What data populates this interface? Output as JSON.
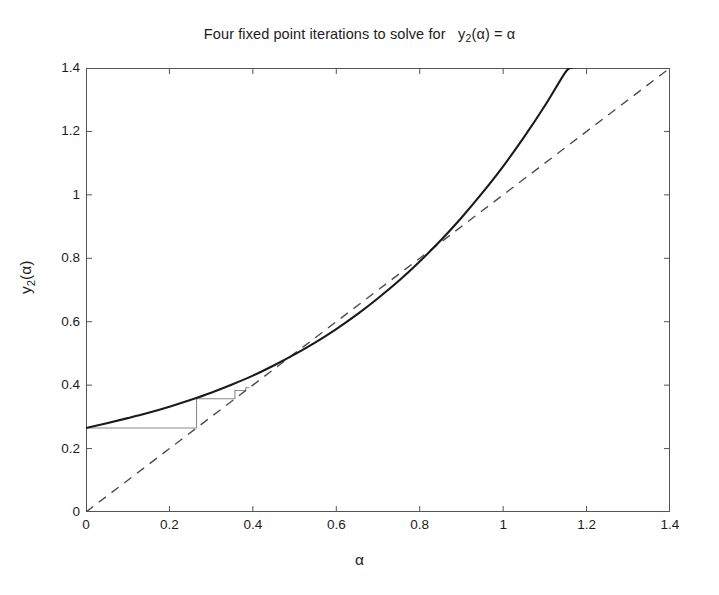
{
  "chart_data": {
    "type": "line",
    "title_parts": {
      "lead": "Four fixed point iterations to solve for",
      "func_base": "y",
      "func_sub": "2",
      "func_arg": "(α)",
      "equals": "=",
      "rhs": "α"
    },
    "xlabel": "α",
    "ylabel": "y₂(α)",
    "ylabel_parts": {
      "base": "y",
      "sub": "2",
      "arg": "(α)"
    },
    "xlim": [
      0,
      1.4
    ],
    "ylim": [
      0,
      1.4
    ],
    "xticks": [
      0,
      0.2,
      0.4,
      0.6,
      0.8,
      1,
      1.2,
      1.4
    ],
    "xtick_labels": [
      "0",
      "0.2",
      "0.4",
      "0.6",
      "0.8",
      "1",
      "1.2",
      "1.4"
    ],
    "yticks": [
      0,
      0.2,
      0.4,
      0.6,
      0.8,
      1,
      1.2,
      1.4
    ],
    "ytick_labels": [
      "0",
      "0.2",
      "0.4",
      "0.6",
      "0.8",
      "1",
      "1.2",
      "1.4"
    ],
    "grid": false,
    "legend": null,
    "box": true,
    "tick_direction": "in",
    "colors": {
      "curve": "#1a1a1a",
      "identity": "#4d4d4d",
      "cobweb": "#8c8c8c",
      "axis": "#555555",
      "background": "#ffffff"
    },
    "series": [
      {
        "name": "y_2(alpha)",
        "style": "solid",
        "width": 2.1,
        "color": "#1a1a1a",
        "comment": "convex increasing curve, y(0)=0.265, fixed point at (1,1), exits top of axes near alpha=1.16",
        "x": [
          0.0,
          0.05,
          0.1,
          0.15,
          0.2,
          0.25,
          0.3,
          0.35,
          0.4,
          0.45,
          0.5,
          0.55,
          0.6,
          0.65,
          0.7,
          0.75,
          0.8,
          0.85,
          0.9,
          0.95,
          1.0,
          1.05,
          1.1,
          1.15,
          1.165
        ],
        "y": [
          0.265,
          0.28,
          0.296,
          0.313,
          0.332,
          0.353,
          0.376,
          0.402,
          0.43,
          0.462,
          0.497,
          0.535,
          0.577,
          0.623,
          0.674,
          0.729,
          0.79,
          0.856,
          0.928,
          1.006,
          1.09,
          1.182,
          1.281,
          1.388,
          1.4
        ]
      },
      {
        "name": "y = alpha",
        "style": "dashed",
        "width": 1.4,
        "color": "#4d4d4d",
        "x": [
          0,
          1.4
        ],
        "y": [
          0,
          1.4
        ]
      }
    ],
    "cobweb": {
      "name": "four fixed point iterations",
      "style": "solid",
      "width": 1.1,
      "color": "#8c8c8c",
      "start": 0.0,
      "iterations": 4,
      "points": [
        [
          0.0,
          0.265
        ],
        [
          0.265,
          0.265
        ],
        [
          0.265,
          0.357
        ],
        [
          0.357,
          0.357
        ],
        [
          0.357,
          0.383
        ],
        [
          0.383,
          0.383
        ],
        [
          0.383,
          0.392
        ],
        [
          0.392,
          0.392
        ]
      ],
      "fixed_point": [
        0.4,
        0.4
      ]
    },
    "annotations": []
  }
}
